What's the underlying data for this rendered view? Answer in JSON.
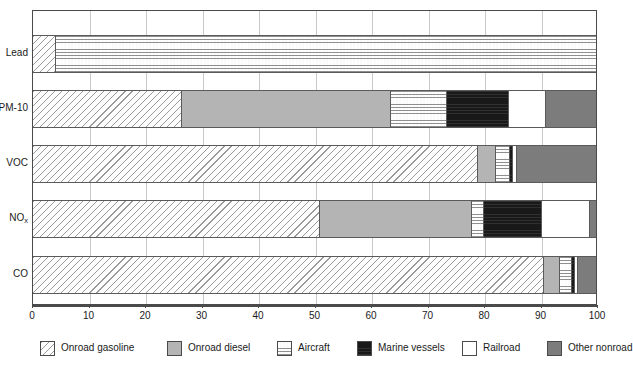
{
  "chart_data": {
    "type": "bar",
    "orientation": "horizontal",
    "stacked": true,
    "title": "",
    "subtitle": "",
    "xlabel": "",
    "ylabel": "",
    "xlim": [
      0,
      100
    ],
    "xticks": [
      0,
      10,
      20,
      30,
      40,
      50,
      60,
      70,
      80,
      90,
      100
    ],
    "xtick_labels": [
      "0",
      "10",
      "20",
      "30",
      "40",
      "50",
      "60",
      "70",
      "80",
      "90",
      "100"
    ],
    "grid": true,
    "grid_axis": "x",
    "legend_position": "bottom",
    "categories": [
      "Lead",
      "PM-10",
      "VOC",
      "NOₓ",
      "CO"
    ],
    "category_labels": [
      {
        "text": "Lead",
        "sub": ""
      },
      {
        "text": "PM-10",
        "sub": ""
      },
      {
        "text": "VOC",
        "sub": ""
      },
      {
        "text": "NO",
        "sub": "x"
      },
      {
        "text": "CO",
        "sub": ""
      }
    ],
    "series": [
      {
        "name": "Onroad gasoline",
        "key": "onroad-gasoline",
        "pattern": "diagonal-hatch",
        "color": "#fdfdfd",
        "values": [
          4.0,
          26.4,
          79.0,
          51.0,
          90.8
        ]
      },
      {
        "name": "Onroad diesel",
        "key": "onroad-diesel",
        "pattern": "solid-gray",
        "color": "#b4b4b4",
        "values": [
          0.0,
          37.1,
          3.2,
          27.0,
          2.8
        ]
      },
      {
        "name": "Aircraft",
        "key": "aircraft",
        "pattern": "fine-stipple",
        "color": "#fafafa",
        "values": [
          96.0,
          10.0,
          2.6,
          2.1,
          2.1
        ]
      },
      {
        "name": "Marine vessels",
        "key": "marine-vessels",
        "pattern": "near-black",
        "color": "#191919",
        "values": [
          0.0,
          11.0,
          0.5,
          10.3,
          0.6
        ]
      },
      {
        "name": "Railroad",
        "key": "railroad",
        "pattern": "white",
        "color": "#ffffff",
        "values": [
          0.0,
          6.6,
          0.6,
          8.6,
          0.5
        ]
      },
      {
        "name": "Other nonroad",
        "key": "other-nonroad",
        "pattern": "dark-gray",
        "color": "#7c7c7c",
        "values": [
          0.0,
          8.9,
          14.1,
          1.0,
          3.2
        ]
      }
    ]
  },
  "legend": {
    "items": [
      {
        "label": "Onroad gasoline",
        "key": "onroad-gasoline"
      },
      {
        "label": "Onroad diesel",
        "key": "onroad-diesel"
      },
      {
        "label": "Aircraft",
        "key": "aircraft"
      },
      {
        "label": "Marine vessels",
        "key": "marine-vessels"
      },
      {
        "label": "Railroad",
        "key": "railroad"
      },
      {
        "label": "Other nonroad",
        "key": "other-nonroad"
      }
    ]
  }
}
